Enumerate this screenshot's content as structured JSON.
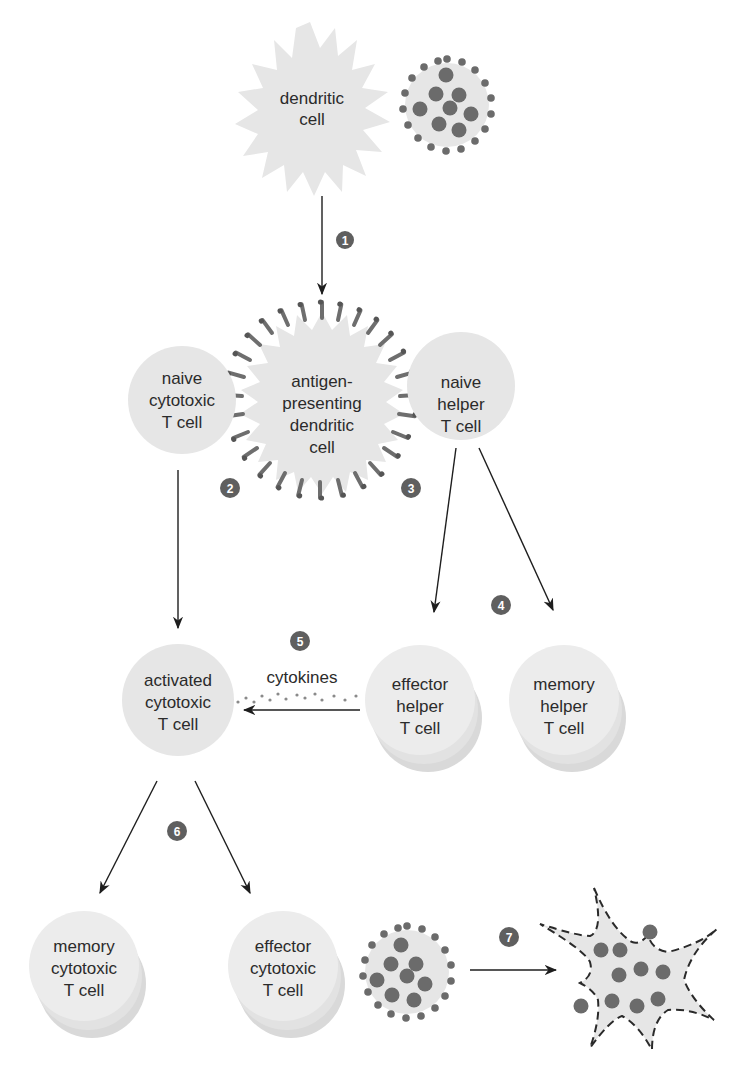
{
  "diagram": {
    "colors": {
      "cell_fill": "#e6e6e6",
      "cell_shadow": "#d9d9d9",
      "dot": "#6b6b6b",
      "step_badge": "#5f5f5f",
      "arrow": "#1e1e1e",
      "text": "#2b2b2b"
    },
    "nodes": {
      "dendritic_cell": {
        "line1": "dendritic",
        "line2": "cell"
      },
      "apc": {
        "line1": "antigen-",
        "line2": "presenting",
        "line3": "dendritic",
        "line4": "cell"
      },
      "naive_cytotoxic": {
        "line1": "naive",
        "line2": "cytotoxic",
        "line3": "T cell"
      },
      "naive_helper": {
        "line1": "naive",
        "line2": "helper",
        "line3": "T cell"
      },
      "activated_cytotoxic": {
        "line1": "activated",
        "line2": "cytotoxic",
        "line3": "T cell"
      },
      "effector_helper": {
        "line1": "effector",
        "line2": "helper",
        "line3": "T cell"
      },
      "memory_helper": {
        "line1": "memory",
        "line2": "helper",
        "line3": "T cell"
      },
      "memory_cytotoxic": {
        "line1": "memory",
        "line2": "cytotoxic",
        "line3": "T cell"
      },
      "effector_cytotoxic": {
        "line1": "effector",
        "line2": "cytotoxic",
        "line3": "T cell"
      },
      "infected_cell": {
        "icon": "infected-cell-icon"
      },
      "lysed_cell": {
        "icon": "lysed-cell-icon"
      }
    },
    "cytokines_label": "cytokines",
    "steps": [
      "1",
      "2",
      "3",
      "4",
      "5",
      "6",
      "7"
    ]
  }
}
